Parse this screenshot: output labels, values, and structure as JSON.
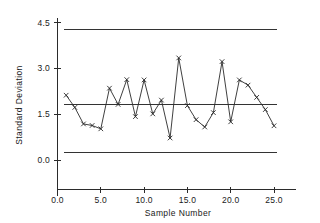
{
  "chart_data": {
    "type": "line",
    "title": "",
    "xlabel": "Sample  Number",
    "ylabel": "Standard  Deviation",
    "xlim": [
      0.0,
      27.5
    ],
    "ylim": [
      -0.6,
      4.9
    ],
    "grid": false,
    "legend": null,
    "xticks": [
      "0.0",
      "5.0",
      "10.0",
      "15.0",
      "20.0",
      "25.0"
    ],
    "xtick_values": [
      0.0,
      5.0,
      10.0,
      15.0,
      20.0,
      25.0
    ],
    "yticks": [
      "0.0",
      "1.5",
      "3.0",
      "4.5"
    ],
    "ytick_values": [
      0.0,
      1.5,
      3.0,
      4.5
    ],
    "x": [
      1,
      2,
      3,
      4,
      5,
      6,
      7,
      8,
      9,
      10,
      11,
      12,
      13,
      14,
      15,
      16,
      17,
      18,
      19,
      20,
      21,
      22,
      23,
      24,
      25
    ],
    "values": [
      2.12,
      1.72,
      1.18,
      1.13,
      1.02,
      2.35,
      1.82,
      2.63,
      1.42,
      2.62,
      1.51,
      1.96,
      0.72,
      3.34,
      1.78,
      1.32,
      1.08,
      1.55,
      3.22,
      1.25,
      2.62,
      2.45,
      2.05,
      1.65,
      1.12
    ],
    "marker": "x",
    "reference_lines": [
      {
        "name": "upper-control-limit",
        "value": 4.27,
        "color": "#333333"
      },
      {
        "name": "center-line",
        "value": 1.82,
        "color": "#333333"
      },
      {
        "name": "lower-control-limit",
        "value": 0.26,
        "color": "#333333"
      }
    ]
  }
}
